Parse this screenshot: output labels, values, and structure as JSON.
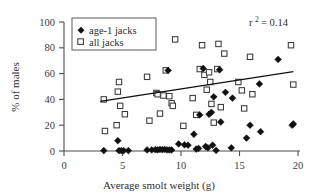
{
  "chart_data": {
    "type": "scatter",
    "title": "",
    "xlabel": "Average smolt weight (g)",
    "ylabel": "% of males",
    "xlim": [
      0,
      20
    ],
    "ylim": [
      0,
      100
    ],
    "xticks": [
      0,
      5,
      10,
      15,
      20
    ],
    "yticks": [
      0,
      20,
      40,
      60,
      80,
      100
    ],
    "grid": false,
    "legend_position": "top-left",
    "annotation": "r² = 0.14",
    "annotation_label": "r",
    "annotation_exponent": "2",
    "annotation_value": "= 0.14",
    "series": [
      {
        "name": "age-1 jacks",
        "marker": "filled-diamond",
        "color": "#101010",
        "points": [
          [
            3.4,
            0.3
          ],
          [
            4.6,
            8.0
          ],
          [
            4.7,
            0.3
          ],
          [
            4.9,
            0.3
          ],
          [
            5.1,
            0.3
          ],
          [
            5.5,
            0.3
          ],
          [
            7.1,
            0.8
          ],
          [
            7.5,
            0.8
          ],
          [
            7.8,
            1.0
          ],
          [
            8.0,
            0.8
          ],
          [
            8.2,
            1.2
          ],
          [
            8.4,
            1.0
          ],
          [
            8.6,
            1.2
          ],
          [
            8.8,
            0.8
          ],
          [
            8.9,
            62.5
          ],
          [
            9.0,
            0.8
          ],
          [
            9.2,
            0.8
          ],
          [
            9.8,
            5.5
          ],
          [
            10.3,
            4.8
          ],
          [
            10.6,
            4.5
          ],
          [
            11.1,
            13.0
          ],
          [
            11.3,
            1.5
          ],
          [
            11.5,
            2.0
          ],
          [
            11.6,
            28.0
          ],
          [
            11.9,
            64.0
          ],
          [
            12.1,
            3.5
          ],
          [
            12.3,
            2.5
          ],
          [
            12.4,
            28.5
          ],
          [
            12.6,
            30.0
          ],
          [
            12.7,
            4.5
          ],
          [
            12.8,
            42.0
          ],
          [
            13.0,
            0.5
          ],
          [
            13.3,
            63.0
          ],
          [
            13.4,
            22.5
          ],
          [
            13.8,
            45.5
          ],
          [
            14.3,
            2.5
          ],
          [
            14.4,
            41.0
          ],
          [
            15.6,
            10.0
          ],
          [
            15.9,
            20.0
          ],
          [
            16.7,
            52.0
          ],
          [
            16.8,
            15.0
          ],
          [
            18.3,
            71.0
          ],
          [
            19.5,
            20.0
          ],
          [
            19.6,
            21.0
          ]
        ]
      },
      {
        "name": "all jacks",
        "marker": "open-square",
        "color": "#3a3a3a",
        "points": [
          [
            3.4,
            40.0
          ],
          [
            3.5,
            15.5
          ],
          [
            4.5,
            20.0
          ],
          [
            4.6,
            46.0
          ],
          [
            4.7,
            53.5
          ],
          [
            4.8,
            35.0
          ],
          [
            5.2,
            28.5
          ],
          [
            7.1,
            57.5
          ],
          [
            7.3,
            23.5
          ],
          [
            7.9,
            45.0
          ],
          [
            8.0,
            44.0
          ],
          [
            8.2,
            29.0
          ],
          [
            8.5,
            43.0
          ],
          [
            8.7,
            62.5
          ],
          [
            9.0,
            42.5
          ],
          [
            9.2,
            37.0
          ],
          [
            9.3,
            35.0
          ],
          [
            9.5,
            86.5
          ],
          [
            10.2,
            19.5
          ],
          [
            11.0,
            41.0
          ],
          [
            11.3,
            28.0
          ],
          [
            11.6,
            63.5
          ],
          [
            11.8,
            82.0
          ],
          [
            12.0,
            59.0
          ],
          [
            12.2,
            47.5
          ],
          [
            12.4,
            61.0
          ],
          [
            12.5,
            53.5
          ],
          [
            12.6,
            36.5
          ],
          [
            12.8,
            22.0
          ],
          [
            13.1,
            63.5
          ],
          [
            13.2,
            83.0
          ],
          [
            13.4,
            34.0
          ],
          [
            13.7,
            75.5
          ],
          [
            14.9,
            53.5
          ],
          [
            15.2,
            47.0
          ],
          [
            15.4,
            33.0
          ],
          [
            15.9,
            73.0
          ],
          [
            16.1,
            44.0
          ],
          [
            19.4,
            82.0
          ],
          [
            19.6,
            51.5
          ]
        ]
      }
    ],
    "fit_line": {
      "name": "regression-line",
      "x_start": 3.1,
      "y_start": 38.5,
      "x_end": 19.6,
      "y_end": 61.5,
      "color": "#101010"
    }
  },
  "legend": {
    "items": [
      {
        "label": "age-1 jacks",
        "marker": "filled-diamond"
      },
      {
        "label": "all jacks",
        "marker": "open-square"
      }
    ]
  },
  "axes": {
    "x_tick_labels": [
      "0",
      "5",
      "10",
      "15",
      "20"
    ],
    "y_tick_labels": [
      "0",
      "20",
      "40",
      "60",
      "80",
      "100"
    ],
    "x_title": "Average smolt weight (g)",
    "y_title": "% of males"
  }
}
